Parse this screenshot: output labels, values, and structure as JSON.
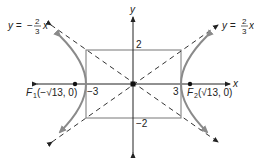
{
  "diagram": {
    "type": "hyperbola",
    "equation_params": {
      "a": 3,
      "b": 2,
      "c_label": "√13"
    },
    "axes": {
      "x_label": "x",
      "y_label": "y"
    },
    "ticks": {
      "x_pos": "3",
      "x_neg": "−3",
      "y_pos": "2",
      "y_neg": "−2"
    },
    "asymptotes": {
      "positive": {
        "lhs": "y =",
        "num": "2",
        "den": "3",
        "var": "x",
        "sign": ""
      },
      "negative": {
        "lhs": "y =",
        "num": "2",
        "den": "3",
        "var": "x",
        "sign": "−"
      }
    },
    "foci": {
      "f1": {
        "name": "F",
        "sub": "1",
        "coord": "(−√13, 0)"
      },
      "f2": {
        "name": "F",
        "sub": "2",
        "coord": "(√13, 0)"
      }
    },
    "colors": {
      "curve": "#8a8a8a",
      "axis": "#222222",
      "box": "#777777",
      "asymptote": "#333333"
    }
  }
}
